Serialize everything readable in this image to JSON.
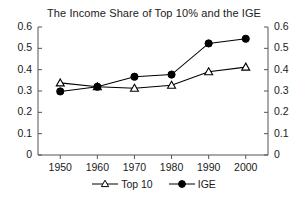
{
  "chart_data": {
    "type": "line",
    "title": "The Income Share of Top 10% and the IGE",
    "xlabel": "",
    "ylabel": "",
    "x": [
      1950,
      1960,
      1970,
      1980,
      1990,
      2000
    ],
    "categories": [
      "1950",
      "1960",
      "1970",
      "1980",
      "1990",
      "2000"
    ],
    "series": [
      {
        "name": "Top 10",
        "marker": "open-triangle",
        "color": "#000000",
        "values": [
          0.338,
          0.32,
          0.313,
          0.327,
          0.39,
          0.412
        ]
      },
      {
        "name": "IGE",
        "marker": "filled-circle",
        "color": "#000000",
        "values": [
          0.298,
          0.32,
          0.367,
          0.377,
          0.523,
          0.545
        ]
      }
    ],
    "ylim": [
      0,
      0.6
    ],
    "xlim": [
      1944,
      2006
    ],
    "yticks": [
      0,
      0.1,
      0.2,
      0.3,
      0.4,
      0.5,
      0.6
    ],
    "ytick_labels": [
      "0",
      "0.1",
      "0.2",
      "0.3",
      "0.4",
      "0.5",
      "0.6"
    ],
    "xticks": [
      1950,
      1960,
      1970,
      1980,
      1990,
      2000
    ],
    "xtick_labels": [
      "1950",
      "1960",
      "1970",
      "1980",
      "1990",
      "2000"
    ],
    "secondary_y_axis": true,
    "secondary_ytick_labels": [
      "0",
      "0.1",
      "0.2",
      "0.3",
      "0.4",
      "0.5",
      "0.6"
    ],
    "grid": false,
    "legend_position": "bottom-center"
  },
  "legend": {
    "items": [
      {
        "label": "Top 10",
        "marker": "open-triangle"
      },
      {
        "label": "IGE",
        "marker": "filled-circle"
      }
    ]
  }
}
